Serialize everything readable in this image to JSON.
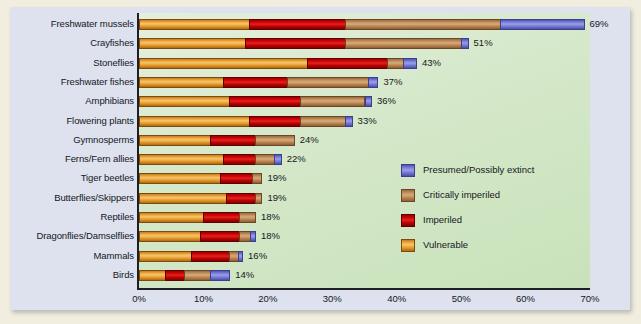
{
  "chart_data": {
    "type": "bar",
    "orientation": "horizontal",
    "stacked": true,
    "title": "",
    "xlabel": "",
    "ylabel": "",
    "xlim": [
      0,
      70
    ],
    "xticks": [
      "0%",
      "10%",
      "20%",
      "30%",
      "40%",
      "50%",
      "60%",
      "70%"
    ],
    "xtick_values": [
      0,
      10,
      20,
      30,
      40,
      50,
      60,
      70
    ],
    "grid": false,
    "legend_position": "inside-right",
    "categories": [
      "Freshwater mussels",
      "Crayfishes",
      "Stoneflies",
      "Freshwater fishes",
      "Amphibians",
      "Flowering plants",
      "Gymnosperms",
      "Ferns/Fern allies",
      "Tiger beetles",
      "Butterflies/Skippers",
      "Reptiles",
      "Dragonflies/Damselflies",
      "Mammals",
      "Birds"
    ],
    "series": [
      {
        "name": "Vulnerable",
        "color": "#eba63f",
        "values": [
          17.0,
          16.5,
          26.0,
          13.0,
          14.0,
          17.0,
          11.0,
          13.0,
          12.5,
          13.5,
          10.0,
          9.5,
          8.0,
          4.0
        ]
      },
      {
        "name": "Imperiled",
        "color": "#cc0000",
        "values": [
          15.0,
          15.5,
          12.5,
          10.0,
          11.0,
          8.0,
          7.0,
          5.0,
          5.0,
          4.5,
          5.5,
          6.0,
          6.0,
          3.0
        ]
      },
      {
        "name": "Critically imperiled",
        "color": "#c2915e",
        "values": [
          24.0,
          18.0,
          2.5,
          12.5,
          10.0,
          7.0,
          6.0,
          3.0,
          1.5,
          1.0,
          2.5,
          1.8,
          1.3,
          4.0
        ]
      },
      {
        "name": "Presumed/Possibly extinct",
        "color": "#7b80d8",
        "values": [
          13.0,
          1.0,
          2.0,
          1.5,
          1.0,
          1.0,
          0.0,
          1.0,
          0.0,
          0.0,
          0.0,
          0.7,
          0.7,
          3.0
        ]
      }
    ],
    "totals": [
      69,
      51,
      43,
      37,
      36,
      33,
      24,
      22,
      19,
      19,
      18,
      18,
      16,
      14
    ],
    "value_labels": [
      "69%",
      "51%",
      "43%",
      "37%",
      "36%",
      "33%",
      "24%",
      "22%",
      "19%",
      "19%",
      "18%",
      "18%",
      "16%",
      "14%"
    ]
  },
  "legend": {
    "items": [
      {
        "label": "Presumed/Possibly extinct",
        "swatch": "ext"
      },
      {
        "label": "Critically imperiled",
        "swatch": "crit"
      },
      {
        "label": "Imperiled",
        "swatch": "imp"
      },
      {
        "label": "Vulnerable",
        "swatch": "vul"
      }
    ]
  },
  "colors": {
    "page_border": "#f2eedf",
    "card_background": "#dde2ee",
    "plot_background": "#d5e8c9",
    "axis": "#1d1f24",
    "text": "#15171c"
  }
}
